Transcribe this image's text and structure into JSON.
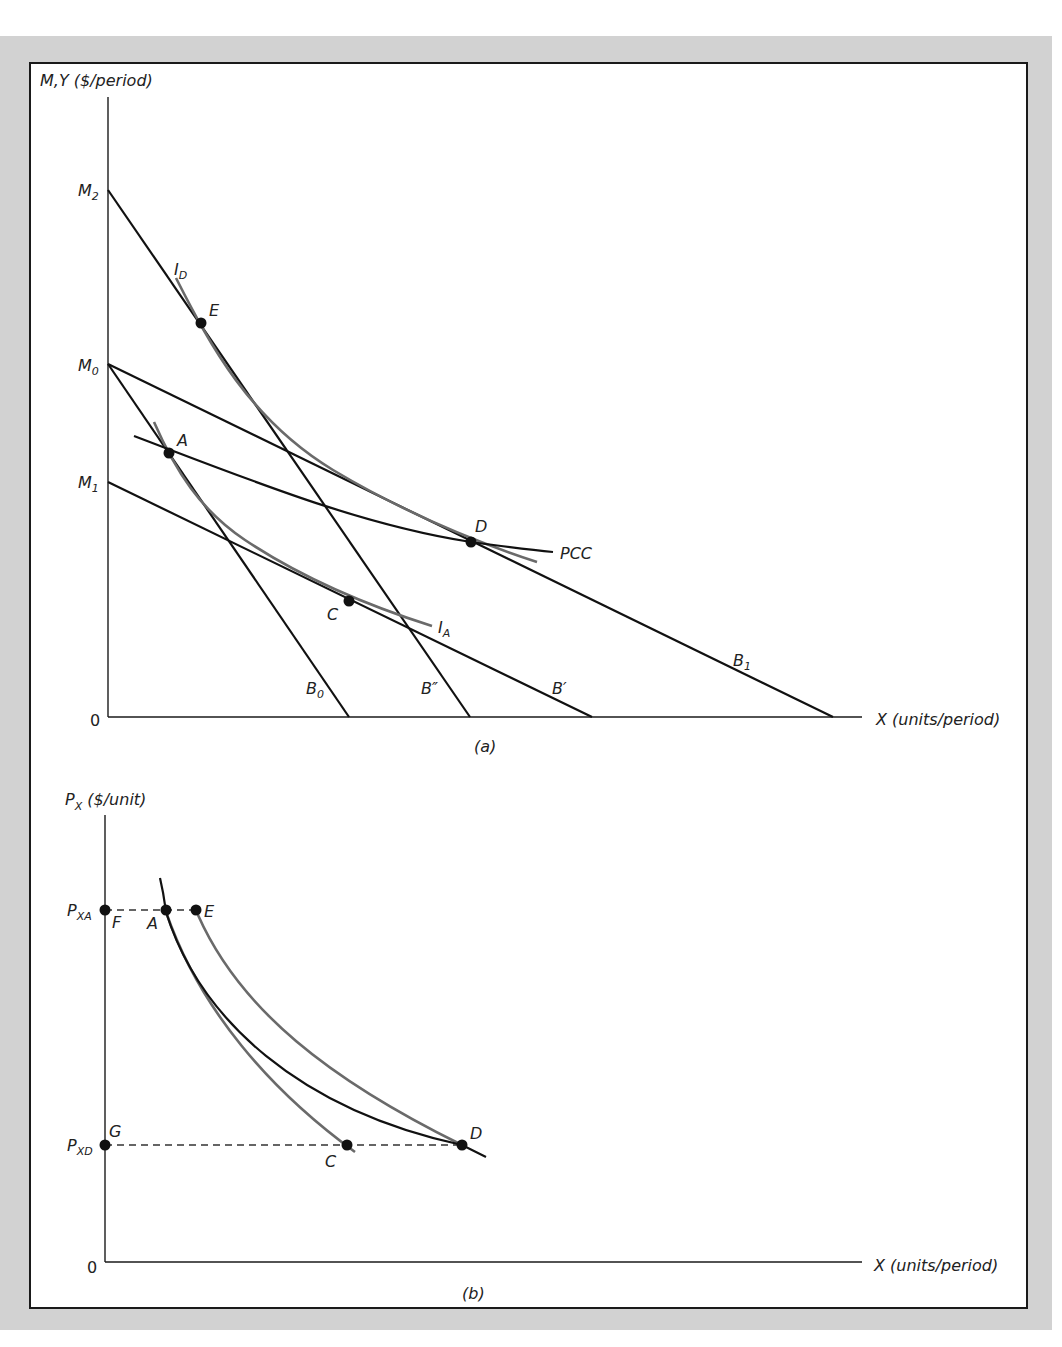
{
  "panel_a": {
    "caption": "(a)",
    "y_axis_label": "M,Y ($/period)",
    "x_axis_label": "X (units/period)",
    "origin_label": "0",
    "intercepts": {
      "M2": "M",
      "M2_sub": "2",
      "M0": "M",
      "M0_sub": "0",
      "M1": "M",
      "M1_sub": "1"
    },
    "budget_lines": [
      {
        "label": "B",
        "sub": "0",
        "from": "M0"
      },
      {
        "label": "B″",
        "sub": "",
        "from": "M2"
      },
      {
        "label": "B′",
        "sub": "",
        "from": "M1"
      },
      {
        "label": "B",
        "sub": "1",
        "from": "M0"
      }
    ],
    "indifference_curves": [
      {
        "label": "I",
        "sub": "D"
      },
      {
        "label": "I",
        "sub": "A"
      }
    ],
    "pcc_label": "PCC",
    "points": {
      "A": "A",
      "C": "C",
      "D": "D",
      "E": "E"
    }
  },
  "panel_b": {
    "caption": "(b)",
    "y_axis_label_main": "P",
    "y_axis_label_sub": "X",
    "y_axis_label_rest": " ($/unit)",
    "x_axis_label": "X (units/period)",
    "origin_label": "0",
    "price_high": {
      "main": "P",
      "sub": "XA"
    },
    "price_low": {
      "main": "P",
      "sub": "XD"
    },
    "points": {
      "F": "F",
      "A": "A",
      "E": "E",
      "G": "G",
      "C": "C",
      "D": "D"
    }
  },
  "colors": {
    "frame_gray": "#d2d2d2",
    "line_black": "#111111",
    "curve_gray": "#6a6a6a"
  }
}
